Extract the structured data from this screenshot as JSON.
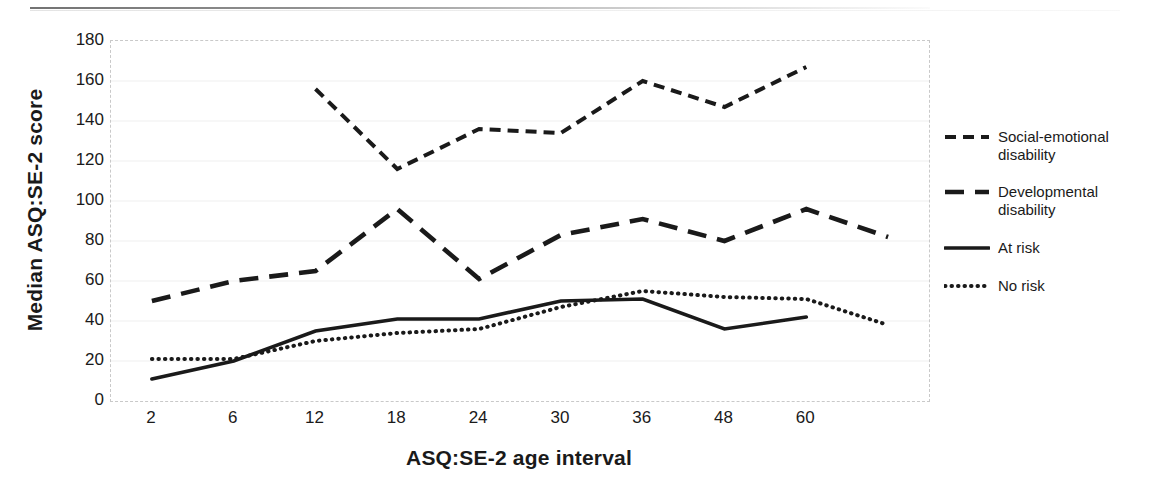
{
  "chart_data": {
    "type": "line",
    "title": "",
    "xlabel": "ASQ:SE-2 age interval",
    "ylabel": "Median ASQ:SE-2 score",
    "categories": [
      "2",
      "6",
      "12",
      "18",
      "24",
      "30",
      "36",
      "48",
      "60",
      ""
    ],
    "tick_labels": [
      "2",
      "6",
      "12",
      "18",
      "24",
      "30",
      "36",
      "48",
      "60"
    ],
    "ylim": [
      0,
      180
    ],
    "ytick_labels": [
      "0",
      "20",
      "40",
      "60",
      "80",
      "100",
      "120",
      "140",
      "160",
      "180"
    ],
    "ytick_values": [
      0,
      20,
      40,
      60,
      80,
      100,
      120,
      140,
      160,
      180
    ],
    "grid": true,
    "legend_position": "right",
    "series": [
      {
        "name": "Social-emotional disability",
        "style": "short-dashed",
        "color": "#1a1a1a",
        "values": [
          null,
          null,
          156,
          116,
          136,
          134,
          160,
          147,
          167,
          null
        ]
      },
      {
        "name": "Developmental disability",
        "style": "long-dashed",
        "color": "#1a1a1a",
        "values": [
          50,
          60,
          65,
          96,
          61,
          83,
          91,
          80,
          96,
          82
        ]
      },
      {
        "name": "At risk",
        "style": "solid",
        "color": "#1a1a1a",
        "values": [
          11,
          20,
          35,
          41,
          41,
          50,
          51,
          36,
          42,
          null
        ]
      },
      {
        "name": "No risk",
        "style": "dotted",
        "color": "#1a1a1a",
        "values": [
          21,
          21,
          30,
          34,
          36,
          47,
          55,
          52,
          51,
          38
        ]
      }
    ]
  },
  "legend": {
    "items": [
      {
        "label_line1": "Social-emotional",
        "label_line2": "disability",
        "style": "short-dashed"
      },
      {
        "label_line1": "Developmental",
        "label_line2": "disability",
        "style": "long-dashed"
      },
      {
        "label_line1": "At risk",
        "label_line2": "",
        "style": "solid"
      },
      {
        "label_line1": "No risk",
        "label_line2": "",
        "style": "dotted"
      }
    ]
  },
  "colors": {
    "line": "#1a1a1a",
    "grid": "#f0f0f0",
    "frame": "#c9c9c9",
    "text": "#1a1a1a",
    "background": "#ffffff"
  }
}
